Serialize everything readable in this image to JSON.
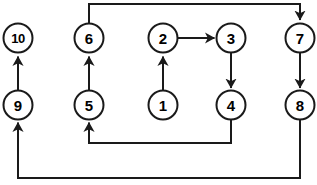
{
  "diagram": {
    "width": 317,
    "height": 185,
    "background_color": "#ffffff",
    "stroke_color": "#1a1a1a",
    "label_color": "#000000",
    "node_radius": 14.5,
    "stroke_width": 2,
    "nodes": [
      {
        "id": "n1",
        "label": "1",
        "cx": 163,
        "cy": 105
      },
      {
        "id": "n2",
        "label": "2",
        "cx": 163,
        "cy": 38
      },
      {
        "id": "n3",
        "label": "3",
        "cx": 231,
        "cy": 38
      },
      {
        "id": "n4",
        "label": "4",
        "cx": 231,
        "cy": 105
      },
      {
        "id": "n5",
        "label": "5",
        "cx": 89,
        "cy": 105
      },
      {
        "id": "n6",
        "label": "6",
        "cx": 89,
        "cy": 38
      },
      {
        "id": "n7",
        "label": "7",
        "cx": 300,
        "cy": 38
      },
      {
        "id": "n8",
        "label": "8",
        "cx": 300,
        "cy": 105
      },
      {
        "id": "n9",
        "label": "9",
        "cx": 18,
        "cy": 105
      },
      {
        "id": "n10",
        "label": "10",
        "cx": 18,
        "cy": 38
      }
    ],
    "edges": [
      {
        "id": "e1",
        "from": "1",
        "to": "2",
        "label": "1-to-2",
        "shape": "straight-up",
        "path": "M 163 90.5 L 163 56.5",
        "arrow": "up"
      },
      {
        "id": "e2",
        "from": "2",
        "to": "3",
        "label": "2-to-3",
        "shape": "straight-right",
        "path": "M 177.5 38 L 214.5 38",
        "arrow": "right"
      },
      {
        "id": "e3",
        "from": "3",
        "to": "4",
        "label": "3-to-4",
        "shape": "straight-down",
        "path": "M 231 52.5 L 231 88",
        "arrow": "down"
      },
      {
        "id": "e4",
        "from": "4",
        "to": "5",
        "label": "4-to-5",
        "shape": "down-left-up",
        "path": "M 231 119.5 L 231 143 L 89 143 L 89 122.5",
        "arrow": "up"
      },
      {
        "id": "e5",
        "from": "5",
        "to": "6",
        "label": "5-to-6",
        "shape": "straight-up",
        "path": "M 89 90.5 L 89 56.5",
        "arrow": "up"
      },
      {
        "id": "e6",
        "from": "6",
        "to": "7",
        "label": "6-to-7",
        "shape": "up-right-down",
        "path": "M 89 23.5 L 89 4 L 300 4 L 300 20",
        "arrow": "down"
      },
      {
        "id": "e7",
        "from": "7",
        "to": "8",
        "label": "7-to-8",
        "shape": "straight-down",
        "path": "M 300 52.5 L 300 88",
        "arrow": "down"
      },
      {
        "id": "e8",
        "from": "8",
        "to": "9",
        "label": "8-to-9",
        "shape": "down-left-up",
        "path": "M 300 119.5 L 300 178 L 18 178 L 18 122.5",
        "arrow": "up"
      },
      {
        "id": "e9",
        "from": "9",
        "to": "10",
        "label": "9-to-10",
        "shape": "straight-up",
        "path": "M 18 90.5 L 18 56.5",
        "arrow": "up"
      }
    ]
  }
}
